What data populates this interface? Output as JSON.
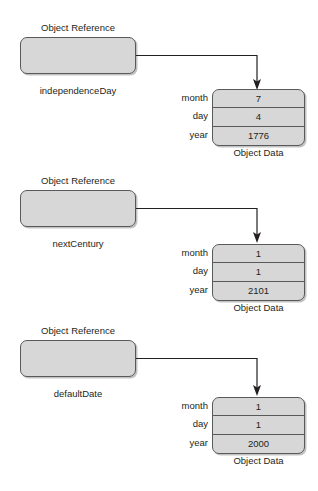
{
  "diagram": {
    "reference_caption": "Object Reference",
    "data_caption": "Object Data",
    "field_labels": [
      "month",
      "day",
      "year"
    ],
    "colors": {
      "box_fill": "#d7d7d7",
      "box_border": "#58595b",
      "text": "#231f20",
      "background": "#ffffff",
      "connector": "#231f20"
    },
    "blocks": [
      {
        "reference_caption": "Object Reference",
        "variable_name": "independenceDay",
        "data_caption": "Object Data",
        "fields": [
          {
            "label": "month",
            "value": "7"
          },
          {
            "label": "day",
            "value": "4"
          },
          {
            "label": "year",
            "value": "1776"
          }
        ]
      },
      {
        "reference_caption": "Object Reference",
        "variable_name": "nextCentury",
        "data_caption": "Object Data",
        "fields": [
          {
            "label": "month",
            "value": "1"
          },
          {
            "label": "day",
            "value": "1"
          },
          {
            "label": "year",
            "value": "2101"
          }
        ]
      },
      {
        "reference_caption": "Object Reference",
        "variable_name": "defaultDate",
        "data_caption": "Object Data",
        "fields": [
          {
            "label": "month",
            "value": "1"
          },
          {
            "label": "day",
            "value": "1"
          },
          {
            "label": "year",
            "value": "2000"
          }
        ]
      }
    ]
  }
}
